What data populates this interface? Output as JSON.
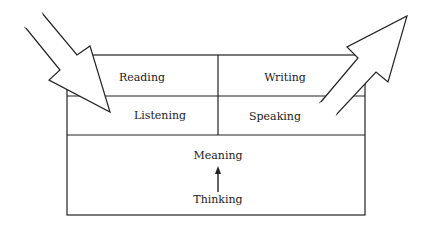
{
  "diagram": {
    "cells": {
      "reading": "Reading",
      "writing": "Writing",
      "listening": "Listening",
      "speaking": "Speaking"
    },
    "core": {
      "top": "Meaning",
      "bottom": "Thinking"
    },
    "arrows": {
      "incoming": "arrow-into-box",
      "outgoing": "arrow-out-of-box"
    },
    "colors": {
      "stroke": "#222222",
      "background": "#ffffff"
    }
  }
}
